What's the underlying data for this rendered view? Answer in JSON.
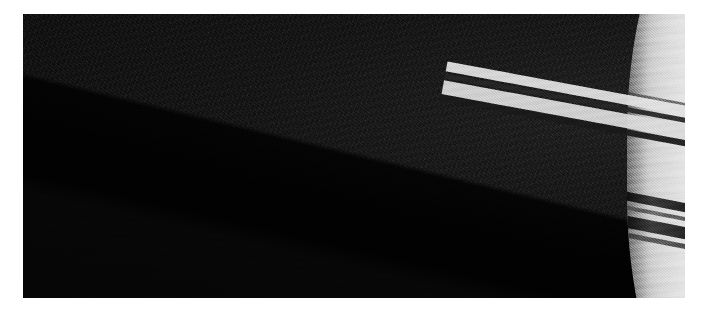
{
  "page": {
    "background_color": "#ffffff",
    "width": 708,
    "height": 313
  },
  "image": {
    "subject": "saturn-rings",
    "alt_text": "Saturn's rings seen at a low angle with the planet's bright limb at the right",
    "kind": "photograph",
    "color_mode": "monochrome",
    "frame": {
      "left": 23,
      "top": 14,
      "width": 662,
      "height": 284
    },
    "background_color": "#0c0c0c",
    "highlight_color": "#eeedea",
    "shadow_color": "#070707"
  },
  "scene": {
    "space_label": "deep space background",
    "planet_label": "Saturn limb",
    "shadow_label": "planet shadow cast across rings",
    "ring_shadow_label": "ring shadows on planet",
    "front_rings_label": "rings crossing in front of planet"
  },
  "rings": [
    {
      "name": "C ring",
      "tone": "#6e6e6e"
    },
    {
      "name": "B ring inner",
      "tone": "#b4b4b4"
    },
    {
      "name": "B ring bright",
      "tone": "#d8d8d8"
    },
    {
      "name": "Cassini Division",
      "tone": "#343434"
    },
    {
      "name": "A ring",
      "tone": "#c0c0c0"
    },
    {
      "name": "Encke Gap",
      "tone": "#787878"
    },
    {
      "name": "F ring",
      "tone": "#e2e2e2"
    }
  ]
}
